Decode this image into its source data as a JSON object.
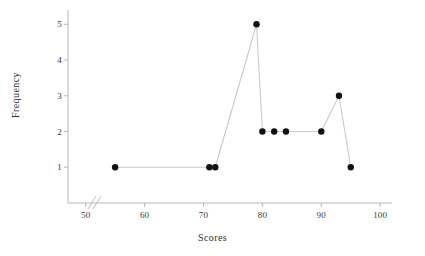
{
  "chart_data": {
    "type": "line",
    "title": "",
    "xlabel": "Scores",
    "ylabel": "Frequency",
    "x": [
      55,
      71,
      72,
      79,
      80,
      82,
      84,
      90,
      93,
      95
    ],
    "values": [
      1,
      1,
      1,
      5,
      2,
      2,
      2,
      2,
      3,
      1
    ],
    "series": [
      {
        "name": "Frequency",
        "points": [
          {
            "x": 55,
            "y": 1
          },
          {
            "x": 71,
            "y": 1
          },
          {
            "x": 72,
            "y": 1
          },
          {
            "x": 79,
            "y": 5
          },
          {
            "x": 80,
            "y": 2
          },
          {
            "x": 82,
            "y": 2
          },
          {
            "x": 84,
            "y": 2
          },
          {
            "x": 90,
            "y": 2
          },
          {
            "x": 93,
            "y": 3
          },
          {
            "x": 95,
            "y": 1
          }
        ]
      }
    ],
    "xlim": [
      47,
      102
    ],
    "ylim": [
      0,
      5.4
    ],
    "xticks": [
      50,
      60,
      70,
      80,
      90,
      100
    ],
    "yticks": [
      1,
      2,
      3,
      4,
      5
    ],
    "xtick_labels": [
      "50",
      "60",
      "70",
      "80",
      "90",
      "100"
    ],
    "ytick_labels": [
      "1",
      "2",
      "3",
      "4",
      "5"
    ],
    "grid": false,
    "legend": false,
    "axis_break": {
      "axis": "x",
      "present": true
    },
    "marker": "filled-circle",
    "colors": {
      "marker": "#111111",
      "line": "#c9c9c9",
      "axis": "#b8b8b8",
      "text": "#3b3b3b"
    }
  }
}
